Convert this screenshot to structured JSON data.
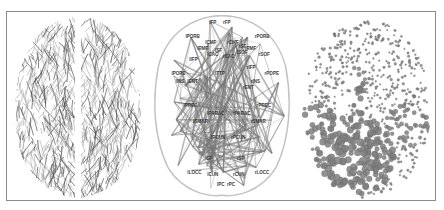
{
  "figure": {
    "panels": [
      {
        "id": "tractography",
        "description": "Axial view of whole-brain white matter fiber tractography"
      },
      {
        "id": "connectome",
        "description": "Axial view of brain network with labeled cortical regions and connecting edges"
      },
      {
        "id": "nodes",
        "description": "Axial view of brain nodes rendered as spheres sized by a nodal metric"
      }
    ],
    "region_labels": [
      "lFP",
      "rFP",
      "lPORB",
      "rPORB",
      "lCMF",
      "rCMF",
      "lRMF",
      "rRMF",
      "lSF",
      "rSF",
      "lSOF",
      "rSOF",
      "lCAC",
      "rCAC",
      "lIFP",
      "rIFP",
      "lPOPE",
      "rPOPE",
      "lINS",
      "rINS",
      "lENT",
      "rENT",
      "lPARAC",
      "rPARAC",
      "lPREC",
      "rPREC",
      "lSMAR",
      "rSMAR",
      "lPCUN",
      "rPCUN",
      "lSP",
      "rSP",
      "lCUN",
      "rCUN",
      "lLOCC",
      "rLOCC",
      "lPC",
      "rPC",
      "lTTP"
    ],
    "colors": {
      "frame": "#8a8a8a",
      "fibers_dark": "#4a4a4a",
      "fibers_light": "#9a9a9a",
      "edges": "#7a7a7a",
      "labels": "#3a3a3a",
      "nodes": "#808080"
    }
  }
}
